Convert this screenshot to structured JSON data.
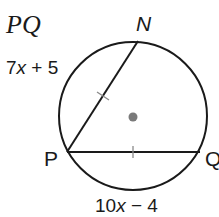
{
  "title": "PQ",
  "points": {
    "N": "N",
    "P": "P",
    "Q": "Q"
  },
  "chords": {
    "PN": {
      "expression_prefix": "7",
      "variable": "x",
      "expression_suffix": " + 5"
    },
    "PQ": {
      "expression_prefix": "10",
      "variable": "x",
      "expression_suffix": " − 4"
    }
  },
  "colors": {
    "stroke": "#1a1a1a",
    "center_dot": "#7a7a7a",
    "tick": "#8a8a8a",
    "background": "#ffffff"
  }
}
